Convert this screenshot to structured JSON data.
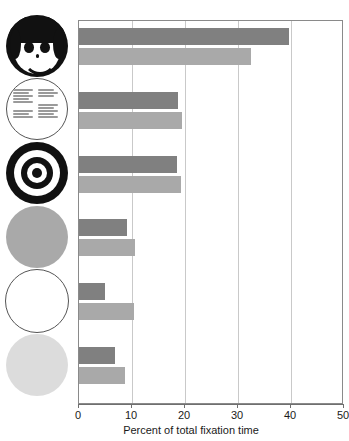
{
  "figure": {
    "title_remnant": "",
    "background": "#ffffff"
  },
  "chart_data": {
    "type": "bar",
    "orientation": "horizontal",
    "title": "",
    "xlabel": "Percent of total fixation time",
    "ylabel": "",
    "xlim": [
      0,
      50
    ],
    "xticks": [
      0,
      10,
      20,
      30,
      40,
      50
    ],
    "xtick_labels": [
      "0",
      "10",
      "20",
      "30",
      "40",
      "50"
    ],
    "grid": "vertical",
    "legend_position": "none",
    "categories": [
      "face-pair-dark",
      "face-pair-light",
      "text-circle-pair-dark",
      "text-circle-pair-light",
      "bullseye-pair-dark",
      "bullseye-pair-light",
      "gray-disc-pair-dark",
      "gray-disc-pair-light",
      "outline-circle-pair-dark",
      "outline-circle-pair-light",
      "pale-disc-pair-dark",
      "pale-disc-pair-light"
    ],
    "values": [
      39.6,
      32.4,
      18.7,
      19.4,
      18.5,
      19.2,
      9.0,
      10.5,
      4.9,
      10.4,
      6.8,
      8.7
    ],
    "colors": {
      "dark_bar": "#808080",
      "light_bar": "#a9a9a9",
      "gridline": "#c9c9c9",
      "axis": "#6f6f6f",
      "plot_border": "#8a8a8a"
    },
    "bars": [
      {
        "index": 1,
        "value": 39.6,
        "shade": "dark",
        "stimulus": "smiley-face"
      },
      {
        "index": 2,
        "value": 32.4,
        "shade": "light",
        "stimulus": "smiley-face"
      },
      {
        "index": 3,
        "value": 18.7,
        "shade": "dark",
        "stimulus": "text-circle"
      },
      {
        "index": 4,
        "value": 19.4,
        "shade": "light",
        "stimulus": "text-circle"
      },
      {
        "index": 5,
        "value": 18.5,
        "shade": "dark",
        "stimulus": "bullseye"
      },
      {
        "index": 6,
        "value": 19.2,
        "shade": "light",
        "stimulus": "bullseye"
      },
      {
        "index": 7,
        "value": 9.0,
        "shade": "dark",
        "stimulus": "gray-disc"
      },
      {
        "index": 8,
        "value": 10.5,
        "shade": "light",
        "stimulus": "gray-disc"
      },
      {
        "index": 9,
        "value": 4.9,
        "shade": "dark",
        "stimulus": "outline-circle"
      },
      {
        "index": 10,
        "value": 10.4,
        "shade": "light",
        "stimulus": "outline-circle"
      },
      {
        "index": 11,
        "value": 6.8,
        "shade": "dark",
        "stimulus": "pale-disc"
      },
      {
        "index": 12,
        "value": 8.7,
        "shade": "light",
        "stimulus": "pale-disc"
      }
    ],
    "stimulus_icons": [
      {
        "name": "smiley-face-icon",
        "label": "face"
      },
      {
        "name": "text-circle-icon",
        "label": "text circle"
      },
      {
        "name": "bullseye-icon",
        "label": "bullseye"
      },
      {
        "name": "gray-disc-icon",
        "label": "gray disc"
      },
      {
        "name": "outline-circle-icon",
        "label": "outline circle"
      },
      {
        "name": "pale-disc-icon",
        "label": "pale disc"
      }
    ]
  }
}
